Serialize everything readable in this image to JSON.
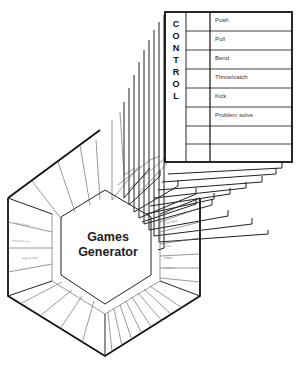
{
  "diagram": {
    "center_title_line1": "Games",
    "center_title_line2": "Generator",
    "card": {
      "category_letters": [
        "C",
        "O",
        "N",
        "T",
        "R",
        "O",
        "L"
      ],
      "category": "CONTROL",
      "rows": [
        "Push",
        "Pull",
        "Bend",
        "Throw/catch",
        "Kick",
        "Problem solve",
        "",
        ""
      ]
    },
    "left_panel_labels": [
      "Low energy",
      "Adventurous",
      "High energy"
    ],
    "right_panel_labels": [
      "Warm-up",
      "Cool down",
      "Dynamic",
      "Static",
      "Indoor",
      "Outdoor",
      "Small group",
      "Large group"
    ],
    "stacked_card_count": 9
  }
}
